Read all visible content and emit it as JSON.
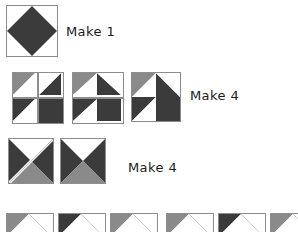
{
  "diagram": {
    "type": "quilt-block-construction",
    "background": "#ffffff",
    "colors": {
      "dark": "#3b3b3b",
      "medium": "#8a8a8a",
      "light": "#ffffff",
      "seam_line": "#8d8d8d",
      "text": "#1c1c1c"
    },
    "rows": [
      {
        "id": "row-1",
        "label": "Make 1",
        "label_x": 66,
        "label_y": 24,
        "units": [
          {
            "id": "square-in-square",
            "name": "square-in-square-unit",
            "x": 6,
            "y": 5,
            "size": 52,
            "shapes": [
              {
                "kind": "diamond",
                "fill": "dark"
              }
            ]
          }
        ]
      },
      {
        "id": "row-2",
        "label": "Make 4",
        "label_x": 190,
        "label_y": 88,
        "units": [
          {
            "id": "four-patch-pieces",
            "name": "four-patch-loose-pieces",
            "x": 12,
            "y": 72,
            "size": 50,
            "gap": 2,
            "quadrants": [
              {
                "pos": "tl",
                "kind": "hst",
                "diag": "tlbr",
                "a": "medium",
                "b": "light"
              },
              {
                "pos": "tr",
                "kind": "hst",
                "diag": "trbl",
                "a": "light",
                "b": "dark"
              },
              {
                "pos": "bl",
                "kind": "hst",
                "diag": "tlbr",
                "a": "dark",
                "b": "light"
              },
              {
                "pos": "br",
                "kind": "solid",
                "a": "dark"
              }
            ]
          },
          {
            "id": "four-patch-rows",
            "name": "four-patch-joined-rows",
            "x": 72,
            "y": 72,
            "size": 50,
            "gap": 2,
            "quadrants": [
              {
                "pos": "tl",
                "kind": "hst",
                "diag": "tlbr",
                "a": "medium",
                "b": "light"
              },
              {
                "pos": "tr",
                "kind": "hst",
                "diag": "trbl",
                "a": "light",
                "b": "dark"
              },
              {
                "pos": "bl",
                "kind": "hst",
                "diag": "tlbr",
                "a": "dark",
                "b": "light"
              },
              {
                "pos": "br",
                "kind": "solid",
                "a": "dark"
              }
            ]
          },
          {
            "id": "four-patch-complete",
            "name": "four-patch-complete-unit",
            "x": 131,
            "y": 72,
            "size": 50,
            "gap": 0,
            "quadrants": [
              {
                "pos": "tl",
                "kind": "hst",
                "diag": "tlbr",
                "a": "medium",
                "b": "light"
              },
              {
                "pos": "tr",
                "kind": "hst",
                "diag": "trbl",
                "a": "light",
                "b": "dark"
              },
              {
                "pos": "bl",
                "kind": "hst",
                "diag": "tlbr",
                "a": "dark",
                "b": "light"
              },
              {
                "pos": "br",
                "kind": "solid",
                "a": "dark"
              }
            ]
          }
        ]
      },
      {
        "id": "row-3",
        "label": "Make 4",
        "label_x": 128,
        "label_y": 160,
        "units": [
          {
            "id": "qst-pieces",
            "name": "quarter-square-triangle-pieces",
            "x": 8,
            "y": 138,
            "size": 46,
            "split": true,
            "triangles": [
              {
                "pos": "top",
                "fill": "light"
              },
              {
                "pos": "left",
                "fill": "dark"
              },
              {
                "pos": "right",
                "fill": "dark"
              },
              {
                "pos": "bottom",
                "fill": "medium"
              }
            ]
          },
          {
            "id": "qst-complete",
            "name": "quarter-square-triangle-unit",
            "x": 60,
            "y": 138,
            "size": 46,
            "split": false,
            "triangles": [
              {
                "pos": "top",
                "fill": "light"
              },
              {
                "pos": "left",
                "fill": "dark"
              },
              {
                "pos": "right",
                "fill": "dark"
              },
              {
                "pos": "bottom",
                "fill": "medium"
              }
            ]
          }
        ]
      },
      {
        "id": "row-4",
        "label": "",
        "units": [
          {
            "id": "geese-strip-left",
            "name": "flying-geese-strip-left",
            "x": 6,
            "y": 213,
            "size": 46,
            "count": 3,
            "gap": 6,
            "cut_off": true
          },
          {
            "id": "geese-strip-right",
            "name": "flying-geese-strip-right",
            "x": 166,
            "y": 213,
            "size": 46,
            "count": 3,
            "gap": 6,
            "cut_off": true
          }
        ]
      }
    ]
  }
}
